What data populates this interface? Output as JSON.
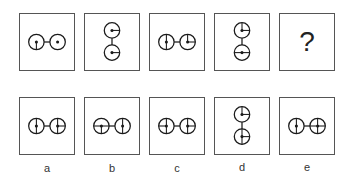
{
  "puzzle": {
    "question_row": [
      {
        "id": "q1",
        "orientation": "horizontal",
        "circles": [
          {
            "lines": [
              "down"
            ]
          },
          {
            "lines": []
          }
        ]
      },
      {
        "id": "q2",
        "orientation": "vertical",
        "circles": [
          {
            "lines": [
              "right"
            ]
          },
          {
            "lines": [
              "right"
            ]
          }
        ]
      },
      {
        "id": "q3",
        "orientation": "horizontal",
        "circles": [
          {
            "lines": [
              "up",
              "down"
            ]
          },
          {
            "lines": [
              "up",
              "right"
            ]
          }
        ]
      },
      {
        "id": "q4",
        "orientation": "vertical",
        "circles": [
          {
            "lines": [
              "up",
              "right"
            ]
          },
          {
            "lines": [
              "left",
              "right"
            ]
          }
        ]
      },
      {
        "id": "q5",
        "unknown": true,
        "symbol": "?"
      }
    ],
    "answer_row": [
      {
        "label": "a",
        "orientation": "horizontal",
        "circles": [
          {
            "lines": [
              "up",
              "down"
            ]
          },
          {
            "lines": [
              "up",
              "down",
              "right"
            ]
          }
        ]
      },
      {
        "label": "b",
        "orientation": "horizontal",
        "circles": [
          {
            "lines": [
              "left",
              "right",
              "down"
            ]
          },
          {
            "lines": [
              "up",
              "down"
            ]
          }
        ]
      },
      {
        "label": "c",
        "orientation": "horizontal",
        "circles": [
          {
            "lines": [
              "left",
              "up",
              "down"
            ]
          },
          {
            "lines": [
              "up",
              "down",
              "right"
            ]
          }
        ]
      },
      {
        "label": "d",
        "orientation": "vertical",
        "circles": [
          {
            "lines": [
              "up",
              "right"
            ]
          },
          {
            "lines": [
              "up",
              "down",
              "right"
            ]
          }
        ]
      },
      {
        "label": "e",
        "orientation": "horizontal",
        "circles": [
          {
            "lines": [
              "up",
              "down"
            ]
          },
          {
            "lines": [
              "up",
              "down",
              "left",
              "right"
            ]
          }
        ]
      }
    ],
    "colors": {
      "stroke": "#1a1a1a",
      "border": "#555555"
    }
  }
}
